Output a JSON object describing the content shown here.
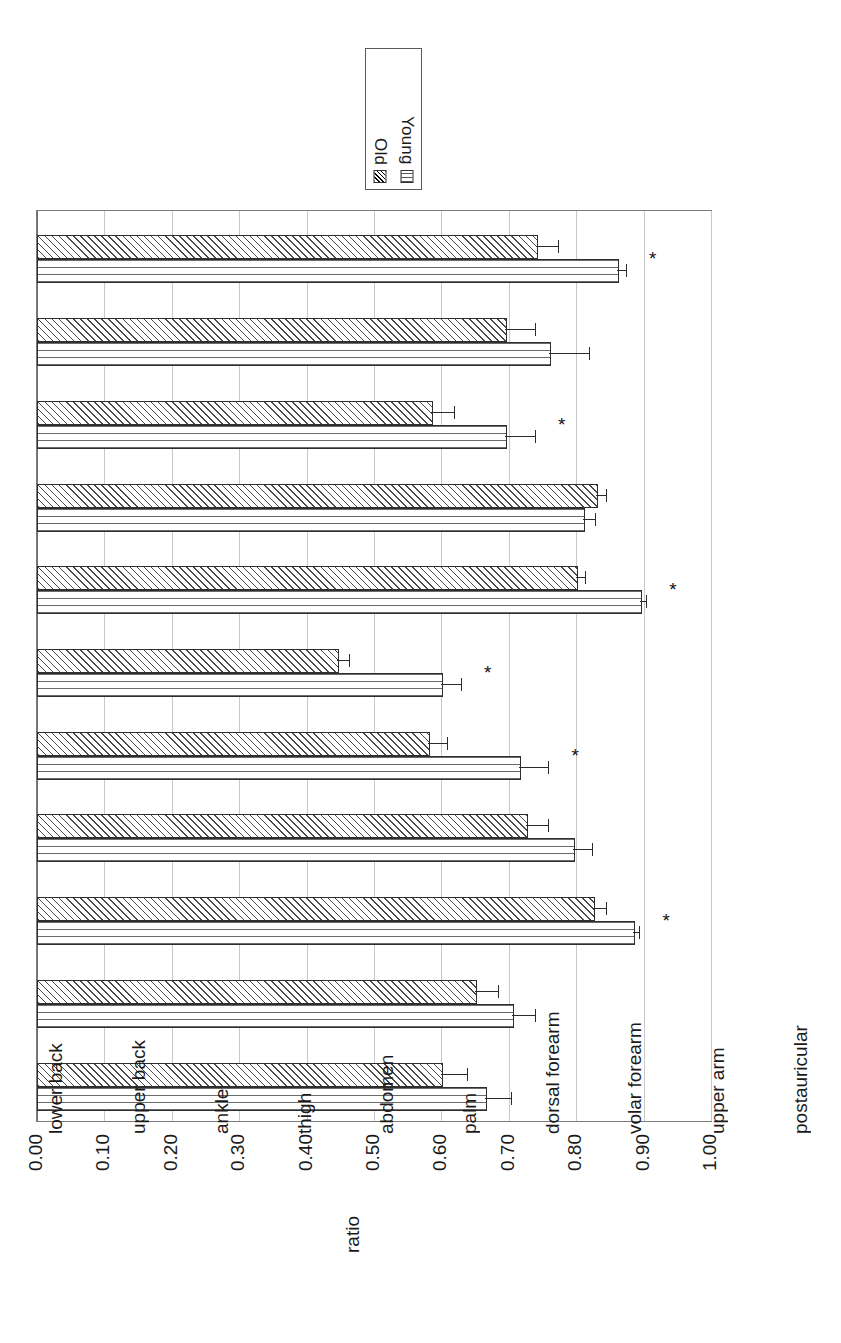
{
  "figure": {
    "orientation": "rotated-90",
    "axis_title": "ratio"
  },
  "legend": {
    "entries": [
      {
        "label": "Old",
        "pattern": "diagonal-hatch"
      },
      {
        "label": "Young",
        "pattern": "grid"
      }
    ]
  },
  "significance_marker": "*",
  "chart_data": {
    "type": "bar",
    "title": "",
    "xlabel": "",
    "ylabel": "ratio",
    "ylim": [
      0.0,
      1.0
    ],
    "grid": true,
    "legend_position": "top-center",
    "orientation": "horizontal",
    "tick_labels": [
      "0.00",
      "0.10",
      "0.20",
      "0.30",
      "0.40",
      "0.50",
      "0.60",
      "0.70",
      "0.80",
      "0.90",
      "1.00"
    ],
    "ticks": [
      0.0,
      0.1,
      0.2,
      0.3,
      0.4,
      0.5,
      0.6,
      0.7,
      0.8,
      0.9,
      1.0
    ],
    "categories": [
      "lower back",
      "upper back",
      "ankle",
      "thigh",
      "abdomen",
      "palm",
      "dorsal forearm",
      "volar forearm",
      "upper arm",
      "postauricular",
      "forehead"
    ],
    "series": [
      {
        "name": "Old",
        "pattern": "diagonal-hatch",
        "values": [
          0.74,
          0.695,
          0.585,
          0.83,
          0.8,
          0.445,
          0.58,
          0.725,
          0.825,
          0.65,
          0.6
        ],
        "errors": [
          0.035,
          0.045,
          0.035,
          0.015,
          0.015,
          0.02,
          0.03,
          0.035,
          0.02,
          0.035,
          0.04
        ]
      },
      {
        "name": "Young",
        "pattern": "grid",
        "values": [
          0.86,
          0.76,
          0.695,
          0.81,
          0.895,
          0.6,
          0.715,
          0.795,
          0.885,
          0.705,
          0.665
        ],
        "errors": [
          0.015,
          0.06,
          0.045,
          0.02,
          0.01,
          0.03,
          0.045,
          0.03,
          0.01,
          0.035,
          0.04
        ]
      }
    ],
    "significant_categories": [
      "lower back",
      "ankle",
      "abdomen",
      "palm",
      "dorsal forearm",
      "upper arm"
    ]
  }
}
